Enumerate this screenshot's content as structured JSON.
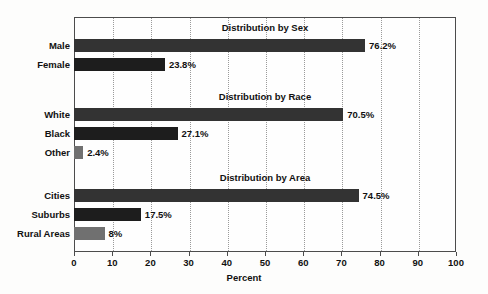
{
  "chart_data": {
    "type": "bar",
    "orientation": "horizontal",
    "title": "",
    "xlabel": "Percent",
    "ylabel": "",
    "xlim": [
      0,
      100
    ],
    "xticks": [
      "0",
      "10",
      "20",
      "30",
      "40",
      "50",
      "60",
      "70",
      "80",
      "90",
      "100"
    ],
    "grid": "vertical-dotted",
    "legend": "none",
    "groups": [
      {
        "title": "Distribution by Sex",
        "categories": [
          "Male",
          "Female"
        ],
        "values": [
          76.2,
          23.8
        ],
        "labels": [
          "76.2%",
          "23.8%"
        ]
      },
      {
        "title": "Distribution by Race",
        "categories": [
          "White",
          "Black",
          "Other"
        ],
        "values": [
          70.5,
          27.1,
          2.4
        ],
        "labels": [
          "70.5%",
          "27.1%",
          "2.4%"
        ]
      },
      {
        "title": "Distribution by Area",
        "categories": [
          "Cities",
          "Suburbs",
          "Rural Areas"
        ],
        "values": [
          74.5,
          17.5,
          8
        ],
        "labels": [
          "74.5%",
          "17.5%",
          "8%"
        ]
      }
    ],
    "colors": {
      "bar_dark": "#333333",
      "bar_darker": "#1d1d1d",
      "bar_mid": "#707070",
      "axis": "#4c4c4c",
      "gridline": "#9a9a9a",
      "text": "#111111",
      "background": "#fdfdfc"
    }
  },
  "axis": {
    "ticks": [
      {
        "label": "0",
        "value": 0
      },
      {
        "label": "10",
        "value": 10
      },
      {
        "label": "20",
        "value": 20
      },
      {
        "label": "30",
        "value": 30
      },
      {
        "label": "40",
        "value": 40
      },
      {
        "label": "50",
        "value": 50
      },
      {
        "label": "60",
        "value": 60
      },
      {
        "label": "70",
        "value": 70
      },
      {
        "label": "80",
        "value": 80
      },
      {
        "label": "90",
        "value": 90
      },
      {
        "label": "100",
        "value": 100
      }
    ],
    "title": "Percent"
  },
  "rows": [
    {
      "kind": "title",
      "text": "Distribution by Sex",
      "y": 22
    },
    {
      "kind": "bar",
      "label": "Male",
      "value": 76.2,
      "value_label": "76.2%",
      "y": 39,
      "shade": "dark"
    },
    {
      "kind": "bar",
      "label": "Female",
      "value": 23.8,
      "value_label": "23.8%",
      "y": 58,
      "shade": "darker"
    },
    {
      "kind": "title",
      "text": "Distribution by Race",
      "y": 91
    },
    {
      "kind": "bar",
      "label": "White",
      "value": 70.5,
      "value_label": "70.5%",
      "y": 108,
      "shade": "dark"
    },
    {
      "kind": "bar",
      "label": "Black",
      "value": 27.1,
      "value_label": "27.1%",
      "y": 127,
      "shade": "darker"
    },
    {
      "kind": "bar",
      "label": "Other",
      "value": 2.4,
      "value_label": "2.4%",
      "y": 146,
      "shade": "mid"
    },
    {
      "kind": "title",
      "text": "Distribution by Area",
      "y": 172
    },
    {
      "kind": "bar",
      "label": "Cities",
      "value": 74.5,
      "value_label": "74.5%",
      "y": 189,
      "shade": "dark"
    },
    {
      "kind": "bar",
      "label": "Suburbs",
      "value": 17.5,
      "value_label": "17.5%",
      "y": 208,
      "shade": "darker"
    },
    {
      "kind": "bar",
      "label": "Rural Areas",
      "value": 8,
      "value_label": "8%",
      "y": 227,
      "shade": "mid"
    }
  ]
}
